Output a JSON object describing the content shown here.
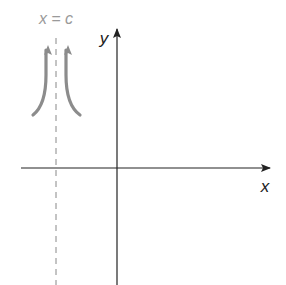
{
  "diagram": {
    "type": "vertical-asymptote-sketch",
    "asymptote_label": "x = c",
    "x_axis_label": "x",
    "y_axis_label": "y",
    "colors": {
      "axes": "#222222",
      "asymptote": "#888888",
      "curves": "#8c8c8c",
      "asymptote_label": "#9a9a9a",
      "axis_labels": "#222222",
      "background": "#ffffff"
    }
  }
}
